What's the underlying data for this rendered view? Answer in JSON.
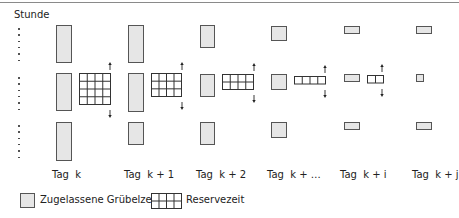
{
  "diagram": {
    "y_axis_label": "Stunde",
    "colors": {
      "permitted_fill": "#e6e6e6",
      "permitted_stroke": "#555555",
      "reserve_stroke": "#333333",
      "rule": "#8a8a8a"
    },
    "days": [
      {
        "label": "Tag  k",
        "x": 56,
        "w": 16,
        "top": [
          25,
          38
        ],
        "mid": [
          73,
          38
        ],
        "bot": [
          122,
          39
        ],
        "grid": {
          "x": 79,
          "y": 73,
          "cols": 4,
          "rows": 4,
          "cw": 7.75,
          "rh": 7.75
        },
        "arrow_x": 107
      },
      {
        "label": "Tag  k + 1",
        "x": 128,
        "w": 16,
        "top": [
          25,
          38
        ],
        "mid": [
          73,
          39
        ],
        "bot": [
          122,
          23
        ],
        "grid": {
          "x": 151,
          "y": 73,
          "cols": 4,
          "rows": 3,
          "cw": 7.5,
          "rh": 7.67
        },
        "arrow_x": 179
      },
      {
        "label": "Tag  k + 2",
        "x": 200,
        "w": 15,
        "top": [
          25,
          23
        ],
        "mid": [
          74,
          23
        ],
        "bot": [
          122,
          23
        ],
        "grid": {
          "x": 222,
          "y": 74,
          "cols": 4,
          "rows": 2,
          "cw": 7.75,
          "rh": 7.5
        },
        "arrow_x": 251
      },
      {
        "label": "Tag  k + …",
        "x": 271,
        "w": 16,
        "top": [
          26,
          15
        ],
        "mid": [
          74,
          16
        ],
        "bot": [
          122,
          16
        ],
        "grid": {
          "x": 294,
          "y": 76,
          "cols": 4,
          "rows": 1,
          "cw": 7.75,
          "rh": 7.5
        },
        "arrow_x": 322
      },
      {
        "label": "Tag  k + i",
        "x": 344,
        "w": 16,
        "top": [
          26,
          8
        ],
        "mid": [
          74,
          8
        ],
        "bot": [
          122,
          8
        ],
        "grid": {
          "x": 367,
          "y": 75,
          "cols": 2,
          "rows": 1,
          "cw": 8,
          "rh": 7.5
        },
        "arrow_x": 379
      },
      {
        "label": "Tag  k + j",
        "x": 416,
        "w": 16,
        "top": [
          26,
          8
        ],
        "mid": [
          74,
          8
        ],
        "bot": [
          122,
          8
        ],
        "mid_w": 8,
        "grid": null,
        "arrow_x": null
      }
    ],
    "legend": [
      {
        "label": "Zugelassene Grübelzeit",
        "type": "permitted"
      },
      {
        "label": "Reservezeit",
        "type": "reserve"
      }
    ]
  }
}
